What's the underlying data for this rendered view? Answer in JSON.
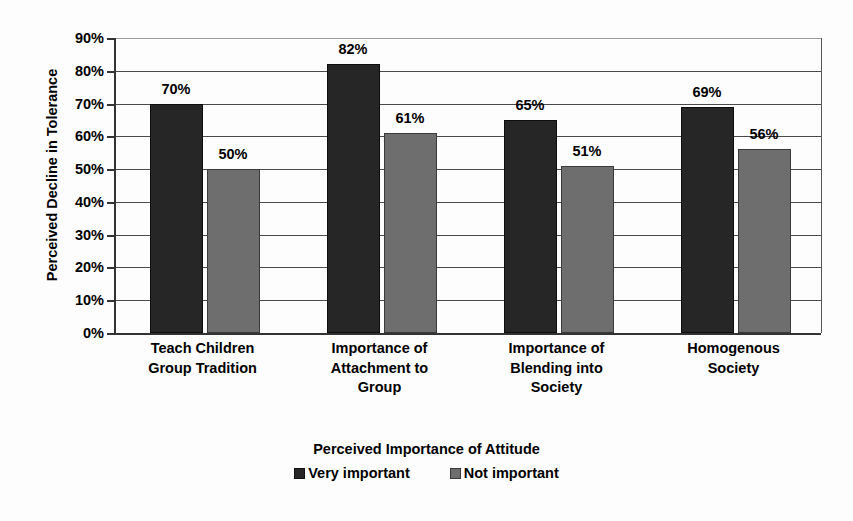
{
  "chart_data": {
    "type": "bar",
    "title": "",
    "xlabel": "Perceived Importance of Attitude",
    "ylabel": "Perceived Decline in Tolerance",
    "categories": [
      "Teach Children\nGroup Tradition",
      "Importance of\nAttachment to\nGroup",
      "Importance of\nBlending into\nSociety",
      "Homogenous\nSociety"
    ],
    "series": [
      {
        "name": "Very important",
        "color": "#262626",
        "values": [
          70,
          82,
          65,
          69
        ],
        "labels": [
          "70%",
          "82%",
          "65%",
          "69%"
        ]
      },
      {
        "name": "Not important",
        "color": "#6e6e6e",
        "values": [
          50,
          61,
          51,
          56
        ],
        "labels": [
          "50%",
          "61%",
          "51%",
          "56%"
        ]
      }
    ],
    "ylim": [
      0,
      90
    ],
    "ytick_values": [
      0,
      10,
      20,
      30,
      40,
      50,
      60,
      70,
      80,
      90
    ],
    "ytick_labels": [
      "0%",
      "10%",
      "20%",
      "30%",
      "40%",
      "50%",
      "60%",
      "70%",
      "80%",
      "90%"
    ],
    "grid": true,
    "legend_position": "bottom",
    "value_labels": true
  },
  "legend": {
    "items": [
      {
        "label": "Very important",
        "color": "#262626"
      },
      {
        "label": "Not important",
        "color": "#6e6e6e"
      }
    ]
  },
  "axis": {
    "x_title": "Perceived Importance of Attitude",
    "y_title": "Perceived Decline in Tolerance"
  }
}
